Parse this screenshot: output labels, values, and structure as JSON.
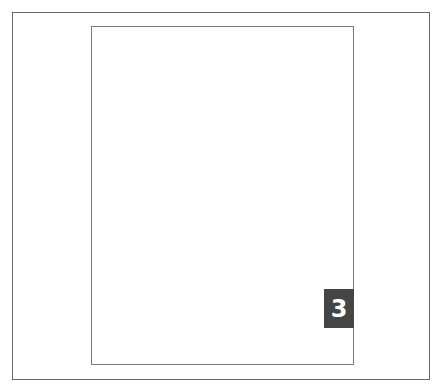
{
  "page": {
    "number_badge": "3",
    "badge_color": "#454545",
    "border_color": "#7a7a7a"
  }
}
